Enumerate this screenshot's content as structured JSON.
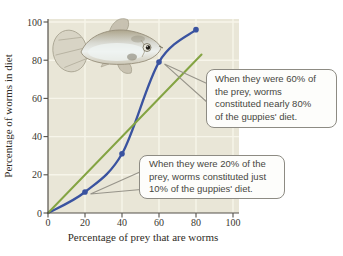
{
  "figure": {
    "description_name": "guppy-prey-preference-figure"
  },
  "chart_data": {
    "type": "line",
    "title": "",
    "xlabel": "Percentage of prey that are worms",
    "ylabel": "Percentage of worms in diet",
    "xlim": [
      0,
      100
    ],
    "ylim": [
      0,
      100
    ],
    "xticks": [
      0,
      20,
      40,
      60,
      80,
      100
    ],
    "yticks": [
      0,
      20,
      40,
      60,
      80,
      100
    ],
    "grid": true,
    "legend": "none",
    "series": [
      {
        "name": "observed-worms-in-diet-curve",
        "style": "curved",
        "color": "#3a53a0",
        "points": [
          [
            0,
            0
          ],
          [
            20,
            11
          ],
          [
            40,
            31
          ],
          [
            60,
            79
          ],
          [
            80,
            96
          ]
        ],
        "marker_points": [
          [
            20,
            11
          ],
          [
            40,
            31
          ],
          [
            60,
            79
          ],
          [
            80,
            96
          ]
        ]
      },
      {
        "name": "proportional-expectation-line",
        "style": "straight",
        "color": "#84a443",
        "points": [
          [
            0,
            0
          ],
          [
            83,
            83
          ]
        ],
        "marker_points": []
      }
    ],
    "annotations": [
      {
        "target": {
          "x": 60,
          "y": 79
        },
        "lines": [
          "When they were 60% of",
          "the prey, worms",
          "constituted nearly 80%",
          "of the guppies' diet."
        ]
      },
      {
        "target": {
          "x": 20,
          "y": 11
        },
        "lines": [
          "When they were 20% of the",
          "prey, worms constituted just",
          "10% of the guppies' diet."
        ]
      }
    ]
  },
  "colors": {
    "plot_bg": "#e9e6d7",
    "gridline": "#f7f5ea",
    "axis": "#55514a",
    "tick_text": "#3a372f",
    "observed_line": "#3a53a0",
    "expected_line": "#84a443",
    "callout_border": "#8d8b83",
    "callout_bg": "#fdfdfb",
    "leader_line": "#97948a"
  }
}
